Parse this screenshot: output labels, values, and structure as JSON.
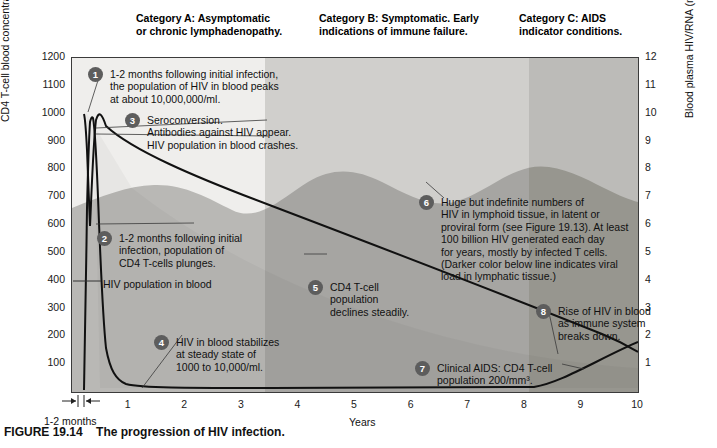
{
  "figure": {
    "number": "FIGURE 19.14",
    "caption": "The progression of HIV infection."
  },
  "categories": [
    {
      "id": "A",
      "line1": "Category A: Asymptomatic",
      "line2": "or chronic lymphadenopathy."
    },
    {
      "id": "B",
      "line1": "Category B: Symptomatic. Early",
      "line2": "indications of immune failure."
    },
    {
      "id": "C",
      "line1": "Category C: AIDS",
      "line2": "indicator conditions."
    }
  ],
  "axes": {
    "y_left_label": "CD4 T-cell blood concentration (cells/mm³)",
    "y_left_ticks": [
      "1200",
      "1100",
      "1000",
      "900",
      "800",
      "700",
      "600",
      "500",
      "400",
      "300",
      "200",
      "100"
    ],
    "y_right_label": "Blood plasma HIV/RNA (millions of copies/ml)",
    "y_right_ticks": [
      "12",
      "11",
      "10",
      "9",
      "8",
      "7",
      "6",
      "5",
      "4",
      "3",
      "2",
      "1"
    ],
    "x_label": "Years",
    "x_ticks": [
      "1",
      "2",
      "3",
      "4",
      "5",
      "6",
      "7",
      "8",
      "9",
      "10"
    ],
    "x_months_marker": "1-2 months"
  },
  "series_labels": {
    "hiv_in_blood": "HIV population in blood"
  },
  "annotations": [
    {
      "num": "1",
      "lines": [
        "1-2 months following initial infection,",
        "the population of HIV in blood peaks",
        "at about 10,000,000/ml."
      ]
    },
    {
      "num": "3",
      "lines": [
        "Seroconversion.",
        "Antibodies against HIV appear.",
        "HIV population in blood crashes."
      ]
    },
    {
      "num": "2",
      "lines": [
        "1-2 months following initial",
        "infection, population of",
        "CD4 T-cells plunges."
      ]
    },
    {
      "num": "4",
      "lines": [
        "HIV in blood stabilizes",
        "at steady state of",
        "1000 to 10,000/ml."
      ]
    },
    {
      "num": "5",
      "lines": [
        "CD4 T-cell",
        "population",
        "declines steadily."
      ]
    },
    {
      "num": "6",
      "lines": [
        "Huge but indefinite numbers of",
        "HIV in lymphoid tissue, in latent or",
        "proviral form (see Figure 19.13). At least",
        "100 billion HIV generated each day",
        "for years, mostly by infected T cells.",
        "(Darker color below line indicates viral",
        "load in lymphatic tissue.)"
      ]
    },
    {
      "num": "8",
      "lines": [
        "Rise of HIV in blood",
        "as immune system",
        "breaks down."
      ]
    },
    {
      "num": "7",
      "lines": [
        "Clinical AIDS: CD4 T-cell",
        "population 200/mm³."
      ]
    }
  ],
  "colors": {
    "band_a": "#efeeec",
    "band_b": "#d0cfcc",
    "band_c": "#bcbbb8",
    "lymphoid_dark": "#b4b3b0",
    "curve": "#111111",
    "badge": "#5d5d5d"
  },
  "chart_data": {
    "type": "line",
    "title": "The progression of HIV infection.",
    "xlabel": "Years",
    "ylabel": "CD4 T-cell blood concentration (cells/mm3)",
    "ylabel_right": "Blood plasma HIV/RNA (millions of copies/ml)",
    "xlim": [
      0,
      10
    ],
    "ylim": [
      0,
      1200
    ],
    "ylim_right": [
      0,
      12
    ],
    "grid": false,
    "legend": "none",
    "x_unit": "years",
    "series": [
      {
        "name": "CD4 T-cell blood concentration",
        "axis": "left",
        "units": "cells/mm3",
        "x": [
          0,
          0.08,
          0.12,
          0.17,
          0.25,
          0.5,
          1,
          2,
          3,
          4,
          5,
          6,
          7,
          8,
          9,
          9.5,
          10
        ],
        "values": [
          1000,
          990,
          900,
          750,
          620,
          900,
          880,
          820,
          760,
          690,
          620,
          540,
          460,
          380,
          270,
          200,
          130
        ]
      },
      {
        "name": "HIV population in blood",
        "axis": "right",
        "units": "millions of copies/ml",
        "x": [
          0,
          0.06,
          0.1,
          0.14,
          0.2,
          0.3,
          0.5,
          1,
          2,
          3,
          4,
          5,
          6,
          7,
          8,
          8.5,
          9,
          9.5,
          10
        ],
        "values": [
          0,
          5.2,
          10.0,
          7.0,
          3.0,
          0.8,
          0.2,
          0.05,
          0.05,
          0.05,
          0.05,
          0.05,
          0.05,
          0.05,
          0.08,
          0.3,
          0.7,
          1.1,
          1.6
        ]
      }
    ],
    "category_bands": [
      {
        "label": "Category A: Asymptomatic or chronic lymphadenopathy.",
        "x_start": 0,
        "x_end": 3.3
      },
      {
        "label": "Category B: Symptomatic. Early indications of immune failure.",
        "x_start": 3.3,
        "x_end": 8.0
      },
      {
        "label": "Category C: AIDS indicator conditions.",
        "x_start": 8.0,
        "x_end": 10
      }
    ],
    "annotations": [
      {
        "num": 1,
        "text": "1-2 months following initial infection, the population of HIV in blood peaks at about 10,000,000/ml.",
        "x": 0.12,
        "y_axis": "right",
        "y": 10
      },
      {
        "num": 2,
        "text": "1-2 months following initial infection, population of CD4 T-cells plunges.",
        "x": 0.2,
        "y_axis": "left",
        "y": 560
      },
      {
        "num": 3,
        "text": "Seroconversion. Antibodies against HIV appear. HIV population in blood crashes.",
        "x": 0.2,
        "y_axis": "right",
        "y": 9
      },
      {
        "num": 4,
        "text": "HIV in blood stabilizes at steady state of 1000 to 10,000/ml.",
        "x": 1.5,
        "y_axis": "right",
        "y": 0.05
      },
      {
        "num": 5,
        "text": "CD4 T-cell population declines steadily.",
        "x": 4.4,
        "y_axis": "left",
        "y": 660
      },
      {
        "num": 6,
        "text": "Huge but indefinite numbers of HIV in lymphoid tissue, in latent or proviral form (see Figure 19.13). At least 100 billion HIV generated each day for years, mostly by infected T cells. (Darker color below line indicates viral load in lymphatic tissue.)",
        "x": 6.5,
        "y_axis": "left",
        "y": 800
      },
      {
        "num": 7,
        "text": "Clinical AIDS: CD4 T-cell population 200/mm3.",
        "x": 8.9,
        "y_axis": "left",
        "y": 200
      },
      {
        "num": 8,
        "text": "Rise of HIV in blood as immune system breaks down.",
        "x": 9.3,
        "y_axis": "right",
        "y": 1.1
      }
    ]
  }
}
